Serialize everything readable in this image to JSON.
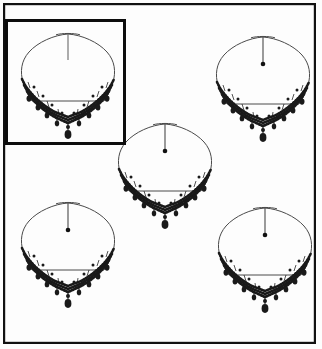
{
  "canvas": {
    "width": 322,
    "height": 349,
    "background_color": "#fdfdfd",
    "ink_color": "#1a1a1a",
    "chain_color": "#4a4a4a"
  },
  "outer_frame": {
    "name": "outer-border",
    "x": 3,
    "y": 3,
    "width": 313,
    "height": 341,
    "stroke_width": 2.2,
    "color": "#111111"
  },
  "selection_box": {
    "name": "selection-rectangle",
    "label": "selected-item-1",
    "x": 5,
    "y": 19,
    "width": 121,
    "height": 126,
    "stroke_width": 3.0,
    "color": "#0d0d0d"
  },
  "items": [
    {
      "id": "necklace-1",
      "label": "Necklace 1",
      "cx": 68,
      "cy": 76,
      "scale": 1.0,
      "selected": true,
      "has_clasp_bead": false,
      "drop_line_length": 26
    },
    {
      "id": "necklace-2",
      "label": "Necklace 2",
      "cx": 263,
      "cy": 79,
      "scale": 1.0,
      "selected": false,
      "has_clasp_bead": true,
      "drop_line_length": 26
    },
    {
      "id": "necklace-3",
      "label": "Necklace 3",
      "cx": 165,
      "cy": 166,
      "scale": 1.0,
      "selected": false,
      "has_clasp_bead": true,
      "drop_line_length": 26
    },
    {
      "id": "necklace-4",
      "label": "Necklace 4",
      "cx": 68,
      "cy": 245,
      "scale": 1.0,
      "selected": false,
      "has_clasp_bead": true,
      "drop_line_length": 26
    },
    {
      "id": "necklace-5",
      "label": "Necklace 5",
      "cx": 265,
      "cy": 250,
      "scale": 1.0,
      "selected": false,
      "has_clasp_bead": true,
      "drop_line_length": 26
    }
  ],
  "necklace_template": {
    "description": "Rounded-diamond chain with a beaded V collar band and dangling teardrops",
    "chain_half_width": 46,
    "chain_top_dip": 6,
    "band_rows": 3,
    "pendant_drops": 9,
    "center_teardrop": true
  }
}
